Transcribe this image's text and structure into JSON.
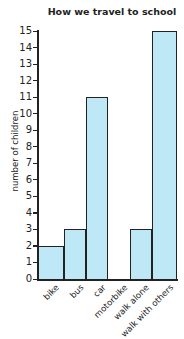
{
  "chart_data": {
    "type": "bar",
    "title": "How we travel to school",
    "xlabel": "",
    "ylabel": "number of children",
    "categories": [
      "bike",
      "bus",
      "car",
      "motorbike",
      "walk alone",
      "walk with others"
    ],
    "values": [
      2,
      3,
      11,
      0,
      3,
      15
    ],
    "ylim": [
      0,
      15
    ],
    "yticks": [
      0,
      1,
      2,
      3,
      4,
      5,
      6,
      7,
      8,
      9,
      10,
      11,
      12,
      13,
      14,
      15
    ],
    "grid": false,
    "legend": null,
    "bar_color": "#bfe8f6",
    "edge_color": "#222222"
  }
}
